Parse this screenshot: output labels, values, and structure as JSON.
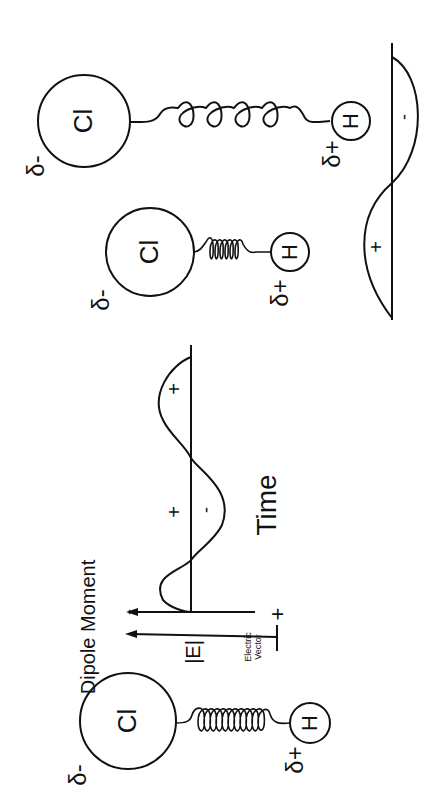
{
  "diagram": {
    "orientation": "rotated 90deg counter-clockwise",
    "molecules": [
      {
        "id": "stretched",
        "atom_large": "Cl",
        "atom_small": "H",
        "charge_large": "δ-",
        "charge_small": "δ+"
      },
      {
        "id": "compressed",
        "atom_large": "Cl",
        "atom_small": "H",
        "charge_large": "δ-",
        "charge_small": "δ+"
      },
      {
        "id": "equilibrium",
        "atom_large": "Cl",
        "atom_small": "H",
        "charge_large": "δ-",
        "charge_small": "δ+"
      }
    ],
    "dipole": {
      "label": "Dipole Moment",
      "neg_sign": "-",
      "pos_sign": "+"
    },
    "electric_wave": {
      "axis_label": "|E|",
      "vector_label_1": "Electric",
      "vector_label_2": "Vector",
      "time_label": "Time",
      "lobes": [
        "+",
        "-",
        "+"
      ]
    },
    "dipole_wave": {
      "lobes": [
        "+",
        "-"
      ]
    }
  }
}
